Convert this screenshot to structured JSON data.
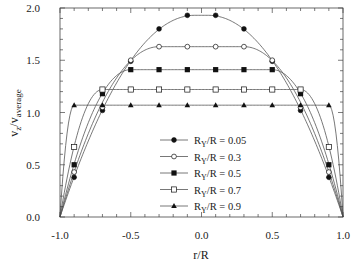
{
  "chart_data": {
    "type": "line",
    "title": "",
    "xlabel": "r/R",
    "ylabel": "v_z/v_average",
    "ylabel_parts": {
      "main": "v",
      "sub1": "z",
      "sep": "/v",
      "sub2": "average"
    },
    "xlim": [
      -1.0,
      1.0
    ],
    "ylim": [
      0.0,
      2.0
    ],
    "x_ticks": [
      -1.0,
      -0.5,
      0.0,
      0.5,
      1.0
    ],
    "x_tick_labels": [
      "-1.0",
      "-0.5",
      "0.0",
      "0.5",
      "1.0"
    ],
    "y_ticks": [
      0.0,
      0.5,
      1.0,
      1.5,
      2.0
    ],
    "y_tick_labels": [
      "0.0",
      "0.5",
      "1.0",
      "1.5",
      "2.0"
    ],
    "grid": false,
    "legend_position": "lower center (inside plot)",
    "series": [
      {
        "name": "R_Y/R = 0.05",
        "label_main": "R",
        "label_sub": "Y",
        "label_rest": "/R = 0.05",
        "marker": "filled-circle",
        "RY": 0.05,
        "x": [
          -0.9,
          -0.7,
          -0.5,
          -0.3,
          -0.1,
          0.1,
          0.3,
          0.5,
          0.7,
          0.9
        ],
        "values": [
          0.38,
          1.02,
          1.49,
          1.8,
          1.93,
          1.93,
          1.8,
          1.49,
          1.02,
          0.38
        ]
      },
      {
        "name": "R_Y/R = 0.3",
        "label_main": "R",
        "label_sub": "Y",
        "label_rest": "/R = 0.3",
        "marker": "open-circle",
        "RY": 0.3,
        "x": [
          -0.9,
          -0.7,
          -0.5,
          -0.3,
          -0.1,
          0.1,
          0.3,
          0.5,
          0.7,
          0.9
        ],
        "values": [
          0.43,
          1.05,
          1.5,
          1.63,
          1.63,
          1.63,
          1.63,
          1.5,
          1.05,
          0.43
        ]
      },
      {
        "name": "R_Y/R = 0.5",
        "label_main": "R",
        "label_sub": "Y",
        "label_rest": "/R = 0.5",
        "marker": "filled-square",
        "RY": 0.5,
        "x": [
          -0.9,
          -0.7,
          -0.5,
          -0.3,
          -0.1,
          0.1,
          0.3,
          0.5,
          0.7,
          0.9
        ],
        "values": [
          0.5,
          1.18,
          1.41,
          1.41,
          1.41,
          1.41,
          1.41,
          1.41,
          1.18,
          0.5
        ]
      },
      {
        "name": "R_Y/R = 0.7",
        "label_main": "R",
        "label_sub": "Y",
        "label_rest": "/R = 0.7",
        "marker": "open-square",
        "RY": 0.7,
        "x": [
          -0.9,
          -0.7,
          -0.5,
          -0.3,
          -0.1,
          0.1,
          0.3,
          0.5,
          0.7,
          0.9
        ],
        "values": [
          0.67,
          1.22,
          1.22,
          1.22,
          1.22,
          1.22,
          1.22,
          1.22,
          1.22,
          0.67
        ]
      },
      {
        "name": "R_Y/R = 0.9",
        "label_main": "R",
        "label_sub": "Y",
        "label_rest": "/R = 0.9",
        "marker": "filled-triangle",
        "RY": 0.9,
        "x": [
          -0.9,
          -0.7,
          -0.5,
          -0.3,
          -0.1,
          0.1,
          0.3,
          0.5,
          0.7,
          0.9
        ],
        "values": [
          1.07,
          1.07,
          1.07,
          1.07,
          1.07,
          1.07,
          1.07,
          1.07,
          1.07,
          1.07
        ]
      }
    ]
  },
  "colors": {
    "line": "#555555",
    "marker": "#111111",
    "axis": "#444444",
    "background": "#ffffff"
  }
}
